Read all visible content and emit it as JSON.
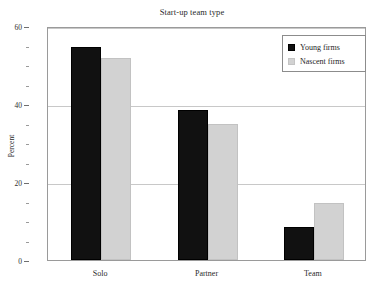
{
  "chart_data": {
    "type": "bar",
    "title": "Start-up team type",
    "xlabel": "",
    "ylabel": "Percent",
    "categories": [
      "Solo",
      "Partner",
      "Team"
    ],
    "series": [
      {
        "name": "Young firms",
        "color": "#111111",
        "values": [
          54.6,
          38.5,
          8.5
        ]
      },
      {
        "name": "Nascent firms",
        "color": "#d2d2d2",
        "values": [
          51.8,
          35.0,
          14.6
        ]
      }
    ],
    "ylim": [
      0,
      60
    ],
    "yticks": [
      0,
      20,
      40,
      60
    ],
    "ytick_labels": [
      "0",
      "20",
      "40",
      "60"
    ],
    "yminor_ticks": [
      5,
      10,
      15,
      25,
      30,
      35,
      45,
      50,
      55
    ],
    "grid": "horizontal",
    "legend_position": "top-right"
  },
  "legend": {
    "items": [
      {
        "label": "Young firms"
      },
      {
        "label": "Nascent firms"
      }
    ]
  }
}
